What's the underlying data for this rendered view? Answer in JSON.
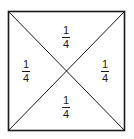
{
  "diagram": {
    "colors": {
      "stroke": "#1a1a1a",
      "background": "#ffffff"
    },
    "regions": [
      {
        "position": "top",
        "numerator": "1",
        "denominator": "4"
      },
      {
        "position": "left",
        "numerator": "1",
        "denominator": "4"
      },
      {
        "position": "right",
        "numerator": "1",
        "denominator": "4"
      },
      {
        "position": "bottom",
        "numerator": "1",
        "denominator": "4"
      }
    ]
  }
}
